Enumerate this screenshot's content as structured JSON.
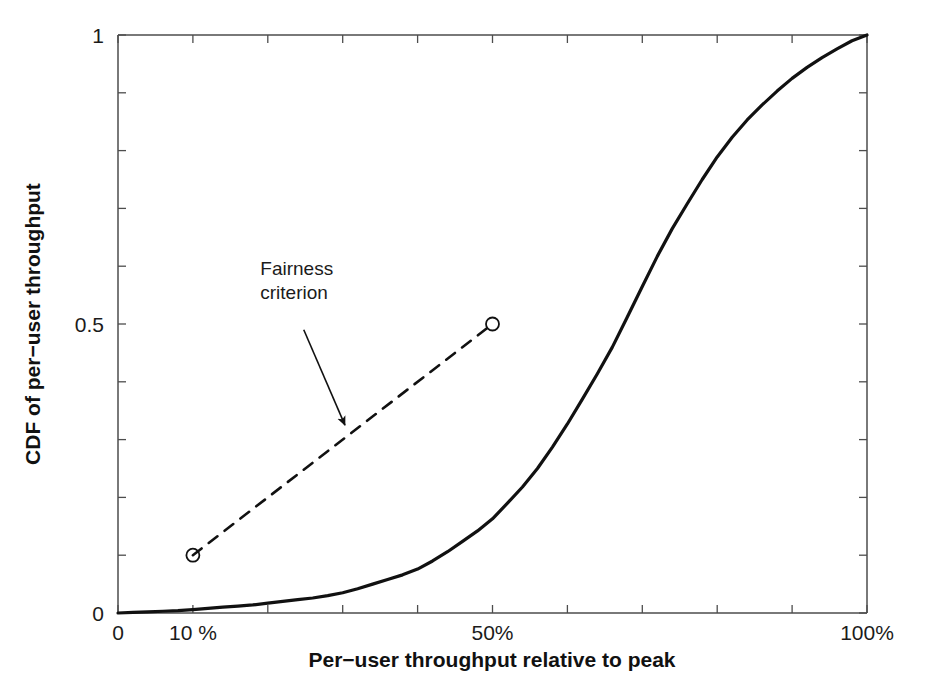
{
  "chart_data": {
    "type": "line",
    "title": "",
    "subtitle": "",
    "xlabel": "Per−user throughput relative to peak",
    "ylabel": "CDF of per−user throughput",
    "xlim": [
      0,
      100
    ],
    "ylim": [
      0,
      1
    ],
    "grid": false,
    "legend_position": "none",
    "x_tick_labels": [
      "0",
      "10 %",
      "50%",
      "100%"
    ],
    "x_tick_values": [
      0,
      10,
      50,
      100
    ],
    "x_minor_tick_values": [
      0,
      10,
      20,
      30,
      40,
      50,
      60,
      70,
      80,
      90,
      100
    ],
    "y_tick_labels": [
      "0",
      "0.5",
      "1"
    ],
    "y_tick_values": [
      0,
      0.5,
      1
    ],
    "y_minor_tick_values": [
      0,
      0.1,
      0.2,
      0.3,
      0.4,
      0.5,
      0.6,
      0.7,
      0.8,
      0.9,
      1
    ],
    "series": [
      {
        "name": "CDF of per-user throughput",
        "style": "solid",
        "color": "#111111",
        "x": [
          0,
          2,
          4,
          6,
          8,
          10,
          12,
          14,
          16,
          18,
          20,
          22,
          24,
          26,
          28,
          30,
          32,
          34,
          36,
          38,
          40,
          42,
          44,
          46,
          48,
          50,
          52,
          54,
          56,
          58,
          60,
          62,
          64,
          66,
          68,
          70,
          72,
          74,
          76,
          78,
          80,
          82,
          84,
          86,
          88,
          90,
          92,
          94,
          96,
          98,
          100
        ],
        "values": [
          0.0,
          0.001,
          0.002,
          0.003,
          0.004,
          0.006,
          0.008,
          0.01,
          0.012,
          0.014,
          0.017,
          0.02,
          0.023,
          0.026,
          0.03,
          0.035,
          0.042,
          0.05,
          0.058,
          0.066,
          0.076,
          0.09,
          0.106,
          0.124,
          0.142,
          0.163,
          0.19,
          0.218,
          0.25,
          0.287,
          0.327,
          0.37,
          0.414,
          0.46,
          0.512,
          0.565,
          0.617,
          0.665,
          0.708,
          0.75,
          0.789,
          0.823,
          0.853,
          0.879,
          0.903,
          0.925,
          0.944,
          0.961,
          0.976,
          0.99,
          1.0
        ]
      },
      {
        "name": "Fairness criterion",
        "style": "dashed",
        "color": "#111111",
        "markers": "circle",
        "x": [
          10,
          50
        ],
        "values": [
          0.1,
          0.5
        ]
      }
    ],
    "annotations": [
      {
        "text_line_1": "Fairness",
        "text_line_2": "criterion",
        "text_x": 19,
        "text_y": 0.585,
        "arrow_from_x": 24.8,
        "arrow_from_y": 0.49,
        "arrow_to_x": 30.3,
        "arrow_to_y": 0.325
      }
    ]
  },
  "axes": {
    "x_label": "Per−user throughput relative to peak",
    "y_label": "CDF of per−user throughput",
    "x_ticks": [
      {
        "label": "0",
        "value": 0
      },
      {
        "label": "10 %",
        "value": 10
      },
      {
        "label": "50%",
        "value": 50
      },
      {
        "label": "100%",
        "value": 100
      }
    ],
    "y_ticks": [
      {
        "label": "0",
        "value": 0
      },
      {
        "label": "0.5",
        "value": 0.5
      },
      {
        "label": "1",
        "value": 1
      }
    ]
  },
  "annotation": {
    "line_1": "Fairness",
    "line_2": "criterion"
  },
  "colors": {
    "axis": "#4d4d4d",
    "curve": "#111111",
    "dashed": "#111111",
    "text": "#1b1b1b",
    "background": "#ffffff"
  }
}
